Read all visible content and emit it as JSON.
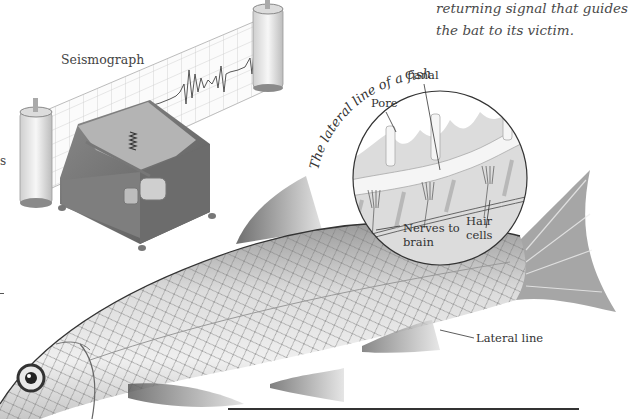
{
  "caption": {
    "lines": [
      "returning signal that guides",
      "the bat to its victim."
    ]
  },
  "seismograph": {
    "title": "Seismograph"
  },
  "lateral_line_inset": {
    "title": "The lateral line of a fish",
    "labels": {
      "pore": "Pore",
      "canal": "Canal",
      "hair_cells_line1": "Hair",
      "hair_cells_line2": "cells",
      "nerves_line1": "Nerves to",
      "nerves_line2": "brain"
    }
  },
  "fish": {
    "lateral_line_label": "Lateral line"
  },
  "left_margin_fragment": "s",
  "colors": {
    "background": "#ffffff",
    "text": "#3a3a3a",
    "inset_fill": "#d9d9d9",
    "canal_fill": "#f4f4f4",
    "metal_dark": "#6e6e6e",
    "metal_light": "#bdbdbd"
  }
}
